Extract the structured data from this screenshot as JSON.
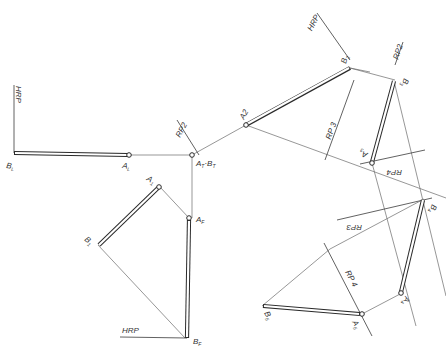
{
  "diagram": {
    "type": "orthographic-projection",
    "colors": {
      "line": "#6a6a6a",
      "rod": "#2a2a2a",
      "background": "#ffffff",
      "text": "#333333"
    },
    "reference_planes": [
      {
        "id": "hrp-left",
        "label": "HRP"
      },
      {
        "id": "hrp-bottom",
        "label": "HRP"
      },
      {
        "id": "hrp-top",
        "label": "HRP"
      },
      {
        "id": "rp2-center",
        "label": "RP2"
      },
      {
        "id": "rp2-right",
        "label": "RP2"
      },
      {
        "id": "rp3-upper",
        "label": "RP 3"
      },
      {
        "id": "rp3-lower",
        "label": "RP3"
      },
      {
        "id": "rp4-upper",
        "label": "RP4"
      },
      {
        "id": "rp4-lower",
        "label": "RP 4"
      }
    ],
    "points": {
      "A_L": {
        "label": "A",
        "sub": "L"
      },
      "B_L": {
        "label": "B",
        "sub": "L"
      },
      "A_T_B_T": {
        "label": "A",
        "sub": "T",
        "label2": "B",
        "sub2": "T"
      },
      "A_F": {
        "label": "A",
        "sub": "F"
      },
      "B_F": {
        "label": "B",
        "sub": "F"
      },
      "A_1": {
        "label": "A",
        "sub": "1"
      },
      "B_1": {
        "label": "B",
        "sub": "1"
      },
      "A_2": {
        "label": "A2"
      },
      "B_2": {
        "label": "B",
        "sub": "2"
      },
      "A_3": {
        "label": "A",
        "sub": "3"
      },
      "B_3": {
        "label": "B",
        "sub": "3"
      },
      "A_4": {
        "label": "A",
        "sub": "4"
      },
      "B_4": {
        "label": "B",
        "sub": "4"
      },
      "A_5": {
        "label": "A",
        "sub": "5"
      },
      "B_5": {
        "label": "B",
        "sub": "5"
      }
    }
  }
}
